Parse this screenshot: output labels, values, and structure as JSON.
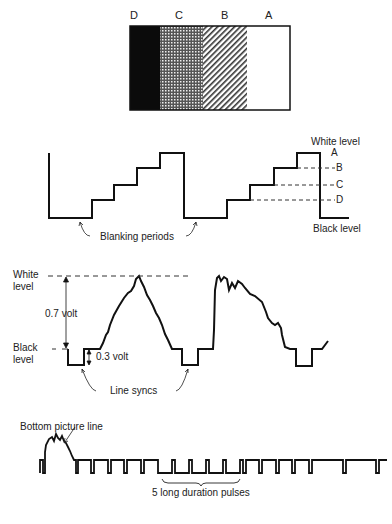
{
  "bars": {
    "labels": [
      "D",
      "C",
      "B",
      "A"
    ],
    "descriptions": [
      "black",
      "dark grey (dotted)",
      "light grey (hatched)",
      "white"
    ]
  },
  "staircase": {
    "white_level_label": "White level",
    "black_level_label": "Black level",
    "blanking_label": "Blanking periods",
    "level_labels": [
      "A",
      "B",
      "C",
      "D"
    ]
  },
  "video_line": {
    "white_level_label_1": "White",
    "white_level_label_2": "level",
    "black_level_label_1": "Black",
    "black_level_label_2": "level",
    "video_amplitude_label": "0.7 volt",
    "sync_amplitude_label": "0.3 volt",
    "line_syncs_label": "Line syncs"
  },
  "field_sync": {
    "bottom_line_label": "Bottom picture line",
    "long_pulses_label": "5 long duration pulses"
  }
}
